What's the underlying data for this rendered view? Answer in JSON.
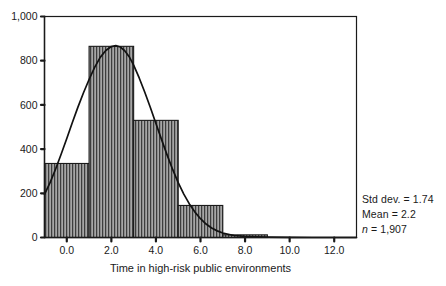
{
  "chart_data": {
    "type": "bar",
    "title": "",
    "subtitle": "",
    "xlabel": "Time in high-risk public environments",
    "ylabel": "",
    "xlim": [
      -1.0,
      13.0
    ],
    "ylim": [
      0,
      1000
    ],
    "grid": false,
    "legend_position": "none",
    "bin_width": 2.0,
    "categories": [
      "-1 to 1",
      "1 to 3",
      "3 to 5",
      "5 to 7",
      "7 to 9",
      "9 to 11",
      "11 to 13"
    ],
    "bin_edges": [
      -1.0,
      1.0,
      3.0,
      5.0,
      7.0,
      9.0,
      11.0,
      13.0
    ],
    "values": [
      335,
      865,
      530,
      145,
      12,
      0,
      0
    ],
    "xticks": [
      "0.0",
      "2.0",
      "4.0",
      "6.0",
      "8.0",
      "10.0",
      "12.0"
    ],
    "xtick_values": [
      0,
      2,
      4,
      6,
      8,
      10,
      12
    ],
    "yticks": [
      "0",
      "200",
      "400",
      "600",
      "800",
      "1,000"
    ],
    "ytick_values": [
      0,
      200,
      400,
      600,
      800,
      1000
    ],
    "overlay_curve": {
      "name": "normal-distribution-curve",
      "mean": 2.2,
      "std_dev": 1.74,
      "peak_value": 868,
      "points": [
        [
          -1.0,
          195
        ],
        [
          -0.75,
          248
        ],
        [
          -0.5,
          310
        ],
        [
          -0.25,
          378
        ],
        [
          0.0,
          448
        ],
        [
          0.25,
          520
        ],
        [
          0.5,
          590
        ],
        [
          0.75,
          655
        ],
        [
          1.0,
          715
        ],
        [
          1.25,
          770
        ],
        [
          1.5,
          815
        ],
        [
          1.75,
          846
        ],
        [
          2.0,
          864
        ],
        [
          2.2,
          868
        ],
        [
          2.4,
          862
        ],
        [
          2.6,
          845
        ],
        [
          2.8,
          818
        ],
        [
          3.0,
          780
        ],
        [
          3.25,
          722
        ],
        [
          3.5,
          657
        ],
        [
          3.75,
          588
        ],
        [
          4.0,
          516
        ],
        [
          4.25,
          444
        ],
        [
          4.5,
          374
        ],
        [
          4.75,
          308
        ],
        [
          5.0,
          248
        ],
        [
          5.25,
          196
        ],
        [
          5.5,
          152
        ],
        [
          5.75,
          115
        ],
        [
          6.0,
          85
        ],
        [
          6.25,
          61
        ],
        [
          6.5,
          43
        ],
        [
          6.75,
          30
        ],
        [
          7.0,
          20
        ],
        [
          7.5,
          9
        ],
        [
          8.0,
          5
        ],
        [
          8.5,
          3
        ],
        [
          9.0,
          2
        ],
        [
          10.0,
          1
        ],
        [
          11.0,
          0
        ],
        [
          13.0,
          0
        ]
      ]
    },
    "annotations": {
      "std_dev": "Std dev. = 1.74",
      "mean": "Mean = 2.2",
      "n_prefix": "n",
      "n_value": " = 1,907"
    },
    "colors": {
      "bar_fill": "#9a9a9a",
      "bar_hatch": "#3a3a3a",
      "bar_edge": "#1a1a1a",
      "curve": "#111111",
      "axis": "#1a1a1a",
      "text": "#1a1a1a",
      "background": "#ffffff"
    }
  }
}
